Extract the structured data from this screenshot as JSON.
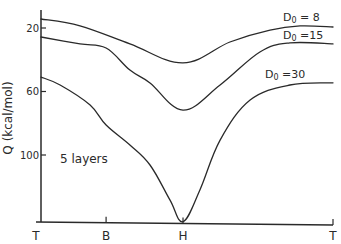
{
  "chart_data": {
    "type": "line",
    "title": "",
    "xlabel": "",
    "ylabel": "Q (kcal/mol)",
    "y_inverted": true,
    "ylim": [
      12,
      142
    ],
    "yticks": [
      20,
      60,
      100
    ],
    "ytick_labels": [
      "20",
      "60",
      "100"
    ],
    "x_ticks": [
      {
        "label": "T",
        "pos": 0.0
      },
      {
        "label": "B",
        "pos": 0.236
      },
      {
        "label": "H",
        "pos": 0.495
      },
      {
        "label": "T",
        "pos": 1.0
      }
    ],
    "xlim": [
      0,
      1
    ],
    "grid": false,
    "annotations": [
      {
        "text": "5 layers",
        "x": 0.1,
        "y": 103
      }
    ],
    "series": [
      {
        "name": "D0 = 8",
        "label_main": "D",
        "label_sub": "0",
        "label_rest": " = 8",
        "x": [
          0.017,
          0.148,
          0.316,
          0.495,
          0.653,
          0.788,
          0.889,
          1.0
        ],
        "y": [
          14.3,
          18.7,
          30.0,
          42.0,
          28.8,
          21.3,
          18.7,
          19.4
        ]
      },
      {
        "name": "D0 = 15",
        "label_main": "D",
        "label_sub": "0",
        "label_rest": " =15",
        "x": [
          0.017,
          0.148,
          0.236,
          0.316,
          0.384,
          0.495,
          0.62,
          0.754,
          0.855,
          1.0
        ],
        "y": [
          25.7,
          30.0,
          32.6,
          46.5,
          54.6,
          71.7,
          55.9,
          35.1,
          29.4,
          30.0
        ]
      },
      {
        "name": "D0 = 30",
        "label_main": "D",
        "label_sub": "0",
        "label_rest": " =30",
        "x": [
          0.017,
          0.081,
          0.182,
          0.236,
          0.316,
          0.384,
          0.451,
          0.495,
          0.552,
          0.62,
          0.721,
          0.855,
          1.0
        ],
        "y": [
          50.9,
          55.9,
          68.5,
          81.1,
          93.7,
          106.3,
          128.3,
          142.0,
          122.0,
          90.6,
          65.4,
          55.9,
          54.6
        ]
      }
    ]
  }
}
